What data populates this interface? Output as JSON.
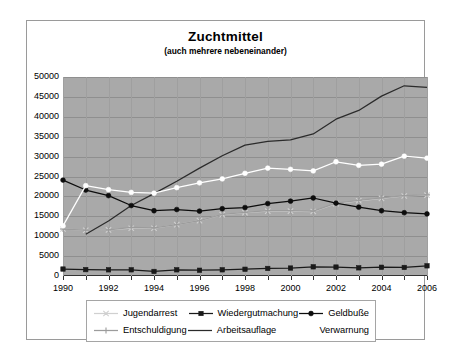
{
  "chart": {
    "title": "Zuchtmittel",
    "subtitle": "(auch mehrere nebeneinander)"
  },
  "chart_data": {
    "type": "line",
    "title": "Zuchtmittel",
    "subtitle": "(auch mehrere nebeneinander)",
    "xlabel": "",
    "ylabel": "",
    "grid": true,
    "legend_position": "bottom",
    "plot_background": "#a9a9a9",
    "ylim": [
      0,
      50000
    ],
    "yticks": [
      0,
      5000,
      10000,
      15000,
      20000,
      25000,
      30000,
      35000,
      40000,
      45000,
      50000
    ],
    "ytick_labels": [
      "0",
      "5000",
      "10000",
      "15000",
      "20000",
      "25000",
      "30000",
      "35000",
      "40000",
      "45000",
      "50000"
    ],
    "xlim": [
      1990,
      2006
    ],
    "x": [
      1990,
      1991,
      1992,
      1993,
      1994,
      1995,
      1996,
      1997,
      1998,
      1999,
      2000,
      2001,
      2002,
      2003,
      2004,
      2005,
      2006
    ],
    "xtick_labels": [
      "1990",
      "",
      "1992",
      "",
      "1994",
      "",
      "1996",
      "",
      "1998",
      "",
      "2000",
      "",
      "2002",
      "",
      "2004",
      "",
      "2006"
    ],
    "series": [
      {
        "name": "Jugendarrest",
        "color": "#d0d0d0",
        "marker": "star",
        "values": [
          11800,
          11500,
          11600,
          12000,
          12000,
          12900,
          13900,
          15400,
          15900,
          16300,
          16300,
          16200,
          18200,
          18900,
          19500,
          20100,
          20300
        ]
      },
      {
        "name": "Entschuldigung",
        "color": "#9c9c9c",
        "marker": "plus",
        "values": [
          11800,
          11500,
          11600,
          12200,
          12100,
          12900,
          13900,
          15500,
          16000,
          16400,
          16400,
          16300,
          18300,
          19000,
          19600,
          20200,
          20400
        ]
      },
      {
        "name": "Wiedergutmachung",
        "color": "#1a1a1a",
        "marker": "square",
        "values": [
          1750,
          1600,
          1550,
          1550,
          1150,
          1550,
          1450,
          1550,
          1700,
          1900,
          2000,
          2300,
          2250,
          2050,
          2200,
          2150,
          2550
        ]
      },
      {
        "name": "Arbeitsauflage",
        "color": "#2b2b2b",
        "marker": "none",
        "values": [
          null,
          10500,
          13800,
          17700,
          20700,
          23800,
          27100,
          30200,
          32900,
          33800,
          34200,
          35700,
          39400,
          41600,
          45200,
          47800,
          47400
        ]
      },
      {
        "name": "Geldbuße",
        "color": "#0d0d0d",
        "marker": "circle",
        "values": [
          24100,
          21600,
          20200,
          17700,
          16400,
          16700,
          16300,
          16900,
          17200,
          18200,
          18800,
          19600,
          18300,
          17300,
          16400,
          15900,
          15600
        ]
      },
      {
        "name": "Verwarnung",
        "color": "#ffffff",
        "marker": "circle",
        "values": [
          12600,
          22700,
          21700,
          21000,
          20800,
          22200,
          23400,
          24400,
          25800,
          27100,
          26800,
          26400,
          28700,
          27800,
          28100,
          30100,
          29600
        ]
      }
    ]
  },
  "legend": {
    "rows": [
      [
        {
          "label": "Jugendarrest",
          "marker": "star-line-light"
        },
        {
          "label": "Wiedergutmachung",
          "marker": "square-line-dark"
        },
        {
          "label": "Geldbuße",
          "marker": "circle-line-dark"
        }
      ],
      [
        {
          "label": "Entschuldigung",
          "marker": "plus-line-gray"
        },
        {
          "label": "Arbeitsauflage",
          "marker": "plain-line-dark"
        },
        {
          "label": "Verwarnung",
          "marker": "plain-line-white"
        }
      ]
    ]
  }
}
